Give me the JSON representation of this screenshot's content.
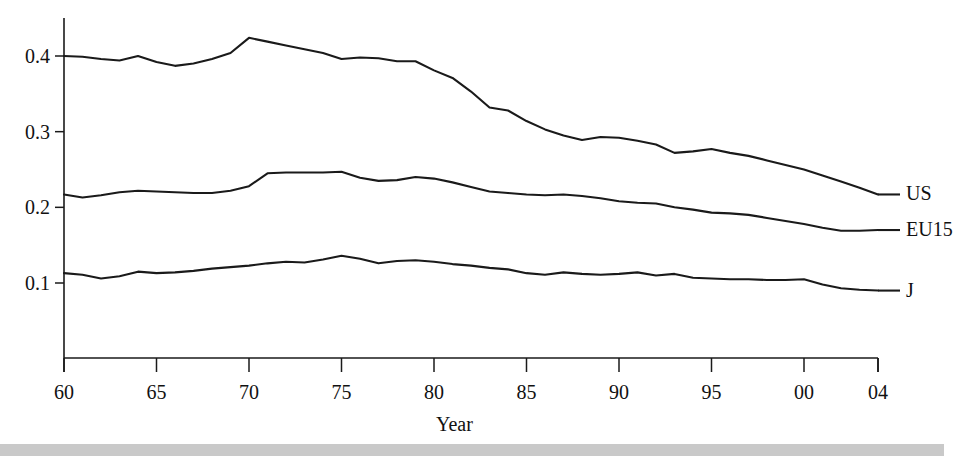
{
  "figure": {
    "background_color": "#ffffff",
    "line_color": "#1a1a1a",
    "bottom_bar_color": "#c9c9c9"
  },
  "axes": {
    "x_axis_title": "Year",
    "y_tick_labels": [
      "0.4",
      "0.3",
      "0.2",
      "0.1"
    ],
    "x_tick_labels": [
      "60",
      "65",
      "70",
      "75",
      "80",
      "85",
      "90",
      "95",
      "00",
      "04"
    ]
  },
  "series_labels": {
    "us": "US",
    "eu15": "EU15",
    "j": "J"
  },
  "chart_data": {
    "type": "line",
    "title": "",
    "xlabel": "Year",
    "ylabel": "",
    "xlim": [
      1960,
      2004
    ],
    "ylim": [
      0.0,
      0.45
    ],
    "grid": false,
    "legend_position": "right-inline",
    "y_ticks": [
      0.1,
      0.2,
      0.3,
      0.4
    ],
    "x_ticks": [
      1960,
      1965,
      1970,
      1975,
      1980,
      1985,
      1990,
      1995,
      2000,
      2004
    ],
    "x_tick_labels": [
      "60",
      "65",
      "70",
      "75",
      "80",
      "85",
      "90",
      "95",
      "00",
      "04"
    ],
    "x": [
      1960,
      1961,
      1962,
      1963,
      1964,
      1965,
      1966,
      1967,
      1968,
      1969,
      1970,
      1971,
      1972,
      1973,
      1974,
      1975,
      1976,
      1977,
      1978,
      1979,
      1980,
      1981,
      1982,
      1983,
      1984,
      1985,
      1986,
      1987,
      1988,
      1989,
      1990,
      1991,
      1992,
      1993,
      1994,
      1995,
      1996,
      1997,
      1998,
      1999,
      2000,
      2001,
      2002,
      2003,
      2004
    ],
    "series": [
      {
        "name": "US",
        "values": [
          0.4,
          0.399,
          0.396,
          0.394,
          0.4,
          0.392,
          0.387,
          0.39,
          0.396,
          0.404,
          0.424,
          0.419,
          0.414,
          0.409,
          0.404,
          0.396,
          0.398,
          0.397,
          0.393,
          0.393,
          0.381,
          0.371,
          0.353,
          0.332,
          0.328,
          0.314,
          0.303,
          0.295,
          0.289,
          0.293,
          0.292,
          0.288,
          0.283,
          0.272,
          0.274,
          0.277,
          0.272,
          0.268,
          0.262,
          0.256,
          0.25,
          0.242,
          0.234,
          0.226,
          0.217
        ]
      },
      {
        "name": "EU15",
        "values": [
          0.217,
          0.213,
          0.216,
          0.22,
          0.222,
          0.221,
          0.22,
          0.219,
          0.219,
          0.222,
          0.228,
          0.245,
          0.246,
          0.246,
          0.246,
          0.247,
          0.239,
          0.235,
          0.236,
          0.24,
          0.238,
          0.233,
          0.227,
          0.221,
          0.219,
          0.217,
          0.216,
          0.217,
          0.215,
          0.212,
          0.208,
          0.206,
          0.205,
          0.2,
          0.197,
          0.193,
          0.192,
          0.19,
          0.186,
          0.182,
          0.178,
          0.173,
          0.169,
          0.169,
          0.17
        ]
      },
      {
        "name": "J",
        "values": [
          0.113,
          0.111,
          0.106,
          0.109,
          0.115,
          0.113,
          0.114,
          0.116,
          0.119,
          0.121,
          0.123,
          0.126,
          0.128,
          0.127,
          0.131,
          0.136,
          0.132,
          0.126,
          0.129,
          0.13,
          0.128,
          0.125,
          0.123,
          0.12,
          0.118,
          0.113,
          0.111,
          0.114,
          0.112,
          0.111,
          0.112,
          0.114,
          0.11,
          0.112,
          0.107,
          0.106,
          0.105,
          0.105,
          0.104,
          0.104,
          0.105,
          0.098,
          0.093,
          0.091,
          0.09
        ]
      }
    ]
  }
}
